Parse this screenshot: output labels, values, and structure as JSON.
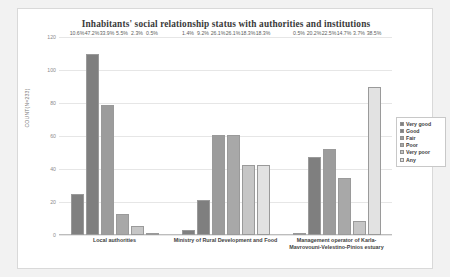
{
  "chart_data": {
    "type": "bar",
    "title": "Inhabitants' social relationship status with authorities and institutions",
    "xlabel": "",
    "ylabel": "COUNT(N=233)",
    "ylim": [
      0,
      120
    ],
    "yticks": [
      "0",
      "20",
      "40",
      "60",
      "80",
      "100",
      "120"
    ],
    "grid": true,
    "legend_position": "right",
    "categories": [
      "Local authorities",
      "Ministry of Rural Development and Food",
      "Management operator of Karla-Mavrovouni-Velestino-Pinios estuary"
    ],
    "series": [
      {
        "name": "Very good",
        "color": "#808080",
        "values": [
          24.7,
          3.3,
          1.2
        ],
        "labels": [
          "10.6%",
          "1.4%",
          "0.5%"
        ]
      },
      {
        "name": "Good",
        "color": "#7f7f7f",
        "values": [
          110.0,
          21.4,
          47.1
        ],
        "labels": [
          "47.2%",
          "9.2%",
          "20.2%"
        ]
      },
      {
        "name": "Fair",
        "color": "#9c9c9c",
        "values": [
          79.0,
          60.8,
          52.4
        ],
        "labels": [
          "33.9%",
          "26.1%",
          "22.5%"
        ]
      },
      {
        "name": "Poor",
        "color": "#a8a8a8",
        "values": [
          12.8,
          60.8,
          34.3
        ],
        "labels": [
          "5.5%",
          "26.1%",
          "14.7%"
        ]
      },
      {
        "name": "Very poor",
        "color": "#c6c6c6",
        "values": [
          5.4,
          42.6,
          8.6
        ],
        "labels": [
          "2.3%",
          "18.3%",
          "3.7%"
        ]
      },
      {
        "name": "Any",
        "color": "#e2e2e2",
        "values": [
          1.2,
          42.6,
          89.7
        ],
        "labels": [
          "0.5%",
          "18.3%",
          "38.5%"
        ]
      }
    ]
  }
}
